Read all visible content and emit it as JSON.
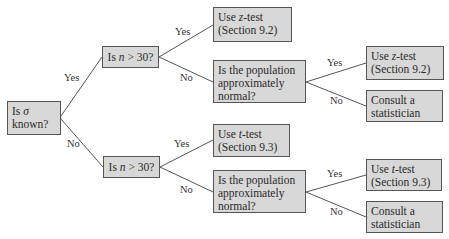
{
  "diagram": {
    "type": "decision-tree",
    "accent": {
      "box_fill": "#d8d8d8",
      "box_border": "#555555",
      "line": "#555555"
    },
    "nodes": {
      "root": {
        "line1_pre": "Is ",
        "line1_sym": "σ",
        "line2": "known?"
      },
      "n_top": {
        "pre": "Is ",
        "var": "n",
        "post": " > 30?"
      },
      "n_bot": {
        "pre": "Is ",
        "var": "n",
        "post": " > 30?"
      },
      "z_top": {
        "line1_pre": "Use ",
        "line1_var": "z",
        "line1_post": "-test",
        "line2": "(Section 9.2)"
      },
      "pop_top": {
        "line1": "Is the population",
        "line2": "approximately",
        "line3": "normal?"
      },
      "z_right": {
        "line1_pre": "Use ",
        "line1_var": "z",
        "line1_post": "-test",
        "line2": "(Section 9.2)"
      },
      "consult_top": {
        "line1": "Consult a",
        "line2": "statistician"
      },
      "t_mid": {
        "line1_pre": "Use ",
        "line1_var": "t",
        "line1_post": "-test",
        "line2": "(Section 9.3)"
      },
      "pop_bot": {
        "line1": "Is the population",
        "line2": "approximately",
        "line3": "normal?"
      },
      "t_right": {
        "line1_pre": "Use ",
        "line1_var": "t",
        "line1_post": "-test",
        "line2": "(Section 9.3)"
      },
      "consult_bot": {
        "line1": "Consult a",
        "line2": "statistician"
      }
    },
    "edge_labels": {
      "root_yes": "Yes",
      "root_no": "No",
      "ntop_yes": "Yes",
      "ntop_no": "No",
      "nbot_yes": "Yes",
      "nbot_no": "No",
      "poptop_yes": "Yes",
      "poptop_no": "No",
      "popbot_yes": "Yes",
      "popbot_no": "No"
    }
  }
}
